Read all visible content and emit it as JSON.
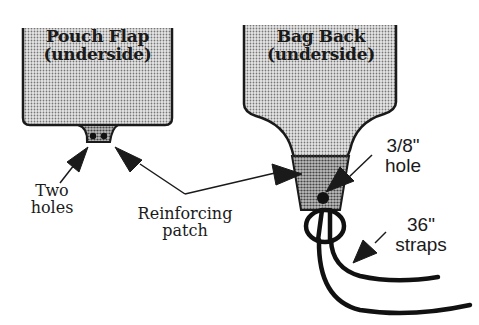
{
  "diagram": {
    "panels": [
      {
        "id": "pouch-flap",
        "title_line1": "Pouch Flap",
        "title_line2": "(underside)"
      },
      {
        "id": "bag-back",
        "title_line1": "Bag Back",
        "title_line2": "(underside)"
      }
    ],
    "callouts": {
      "two_holes": {
        "line1": "Two",
        "line2": "holes"
      },
      "reinforcing_patch": {
        "line1": "Reinforcing",
        "line2": "patch"
      },
      "hole_size": {
        "line1": "3/8\"",
        "line2": "hole"
      },
      "straps": {
        "line1": "36\"",
        "line2": "straps"
      }
    },
    "colors": {
      "ink": "#1a1a1a",
      "panel_fill": "#cfcfcf",
      "patch_fill": "#9a9a9a",
      "background": "#ffffff"
    }
  }
}
